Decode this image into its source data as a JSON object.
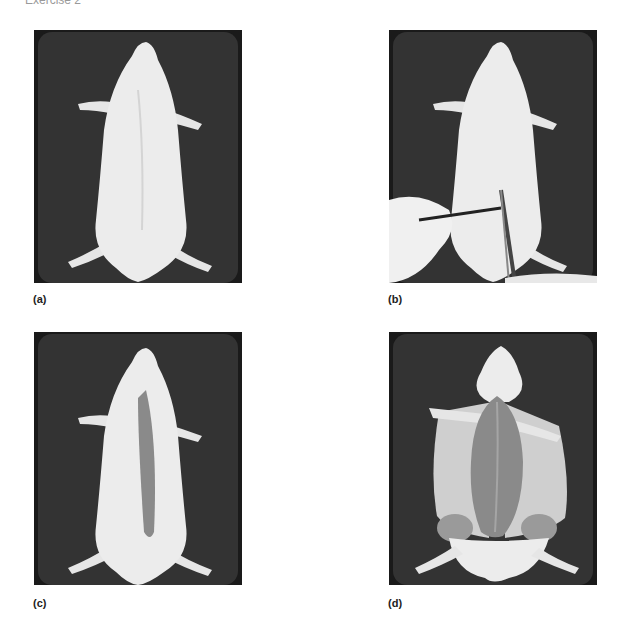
{
  "header": {
    "title": "Exercise 2"
  },
  "panels": [
    {
      "id": "a",
      "label": "(a)",
      "description": "Rat pinned ventral side up on dissecting tray, intact"
    },
    {
      "id": "b",
      "label": "(b)",
      "description": "Forceps lifting skin while scissors make a midline incision"
    },
    {
      "id": "c",
      "label": "(c)",
      "description": "Midline skin incision exposing underlying muscle"
    },
    {
      "id": "d",
      "label": "(d)",
      "description": "Skin reflected laterally exposing ventral musculature"
    }
  ],
  "colors": {
    "tray": "#2e2e2e",
    "tray_edge": "#111111",
    "fur": "#ececec",
    "muscle": "#8a8a8a",
    "skin_inner": "#cfcfcf",
    "label": "#222222"
  }
}
